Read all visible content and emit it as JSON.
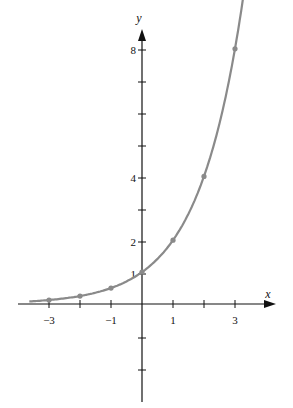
{
  "chart_data": {
    "type": "line",
    "title": "",
    "function": "y = 2^x",
    "xlabel": "x",
    "ylabel": "y",
    "x_ticks": [
      -3,
      -2,
      -1,
      0,
      1,
      2,
      3
    ],
    "x_tick_labels": [
      "−3",
      "",
      "−1",
      "",
      "1",
      "",
      "3"
    ],
    "y_ticks": [
      -3,
      -2,
      -1,
      1,
      2,
      3,
      4,
      5,
      6,
      7,
      8
    ],
    "y_tick_labels": {
      "1": "1",
      "2": "2",
      "4": "4",
      "8": "8"
    },
    "points": [
      {
        "x": -3,
        "y": 0.125
      },
      {
        "x": -2,
        "y": 0.25
      },
      {
        "x": -1,
        "y": 0.5
      },
      {
        "x": 0,
        "y": 1
      },
      {
        "x": 1,
        "y": 2
      },
      {
        "x": 2,
        "y": 4
      },
      {
        "x": 3,
        "y": 8
      }
    ],
    "xlim": [
      -3.6,
      4.2
    ],
    "ylim": [
      -3.1,
      8.6
    ],
    "grid": false,
    "curve_color": "#8a8a8a",
    "axis_color": "#111111"
  },
  "labels": {
    "x_axis": "x",
    "y_axis": "y",
    "x_m3": "−3",
    "x_m1": "−1",
    "x_1": "1",
    "x_3": "3",
    "y_1": "1",
    "y_2": "2",
    "y_4": "4",
    "y_8": "8"
  }
}
